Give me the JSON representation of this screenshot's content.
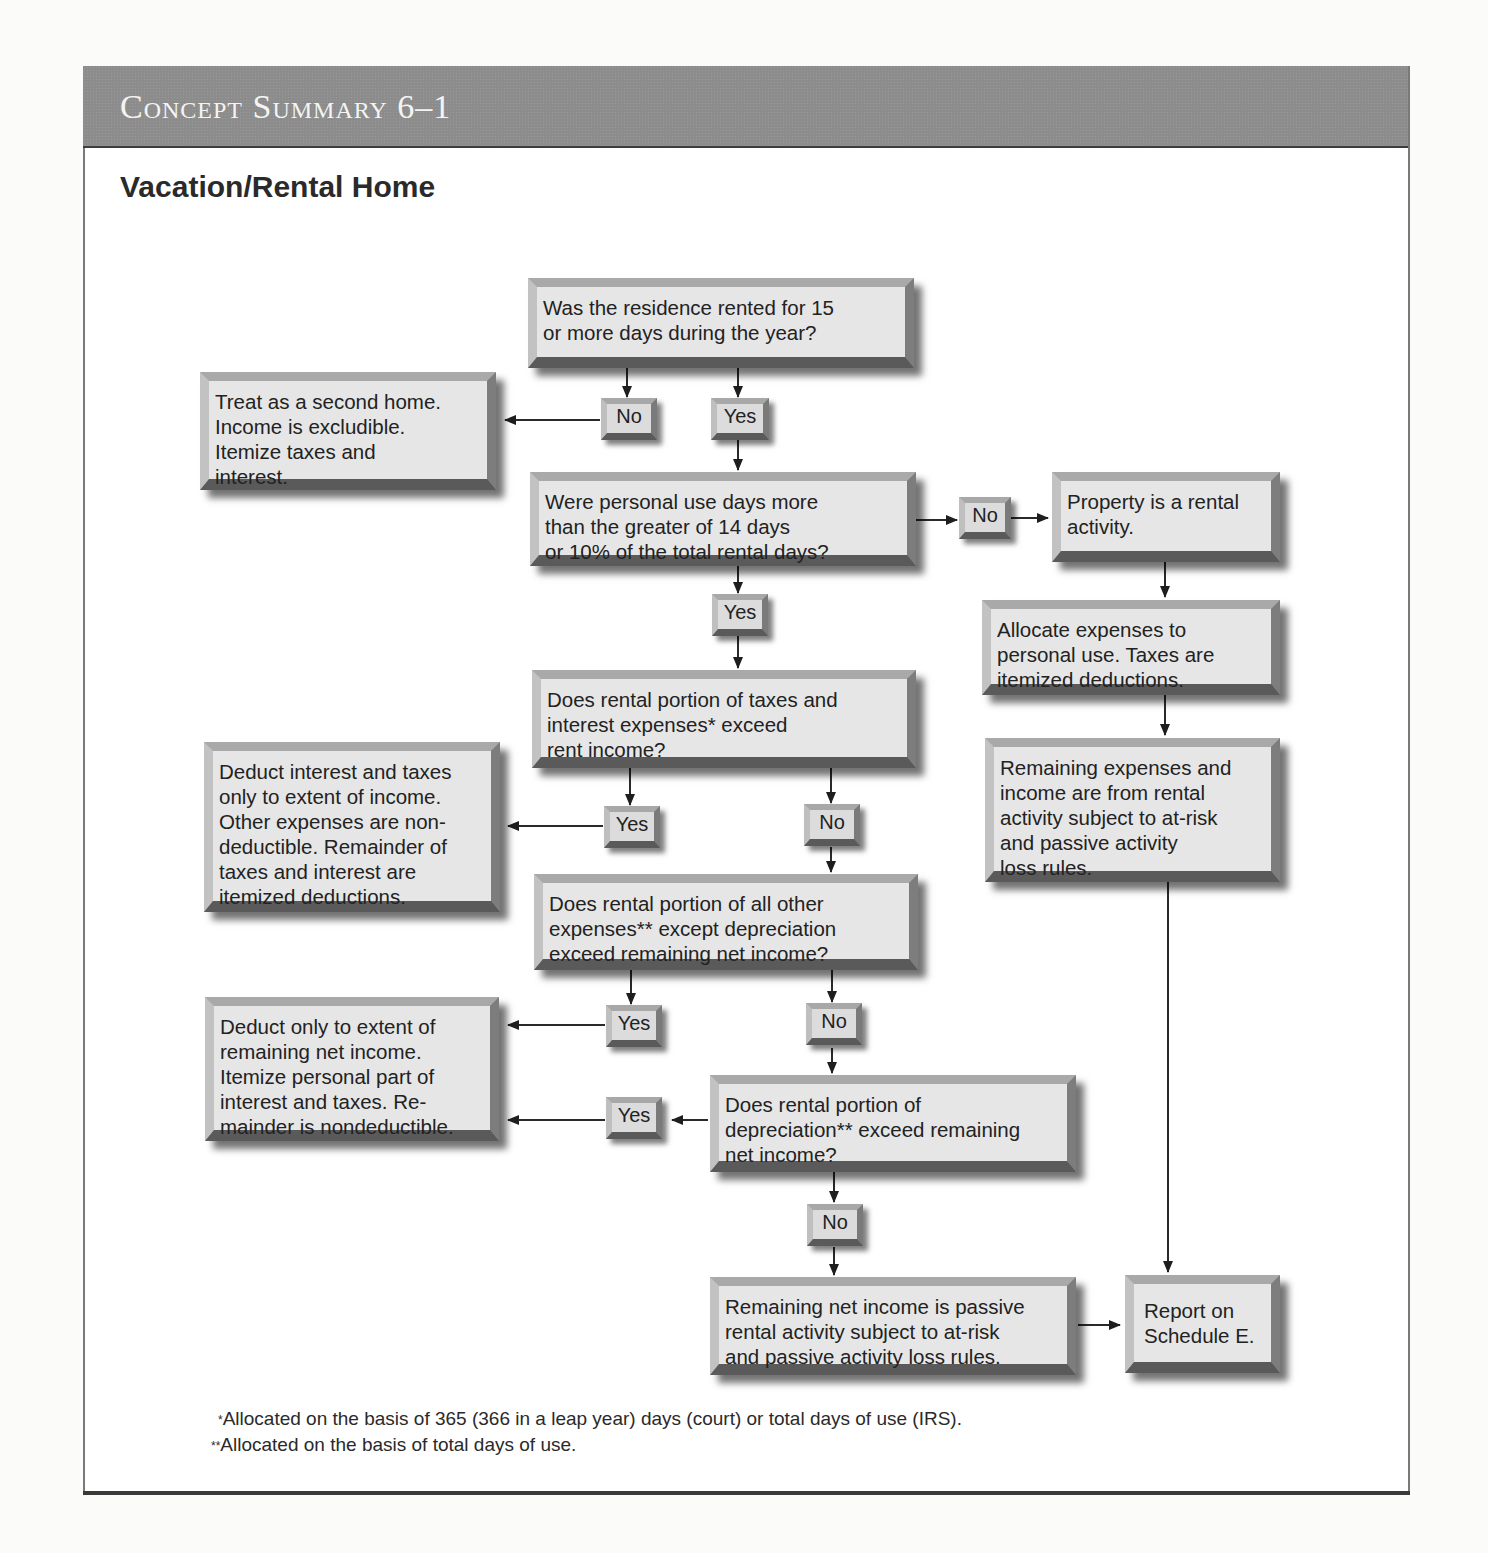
{
  "header": {
    "title": "Concept Summary 6–1",
    "subtitle": "Vacation/Rental Home"
  },
  "flowchart": {
    "nodes": {
      "q1": "Was the residence rented for 15\nor more days during the year?",
      "second_home": "Treat as a second home.\nIncome is excludible.\nItemize taxes and\ninterest.",
      "q2": "Were personal use days more\nthan the greater of 14 days\nor 10% of the total rental days?",
      "rental_activity": "Property is a rental\nactivity.",
      "allocate": "Allocate expenses to\npersonal use. Taxes are\nitemized deductions.",
      "remaining_rental": "Remaining expenses and\nincome are from rental\nactivity subject to at-risk\nand passive activity\nloss rules.",
      "q3": "Does rental portion of taxes and\ninterest expenses* exceed\nrent income?",
      "deduct_interest": "Deduct interest and taxes\nonly to extent of income.\nOther expenses are non-\ndeductible. Remainder of\ntaxes and interest are\nitemized deductions.",
      "q4": "Does rental portion of all other\nexpenses** except depreciation\nexceed remaining net income?",
      "deduct_remaining": "Deduct only to extent of\nremaining net income.\nItemize personal part of\ninterest and taxes. Re-\nmainder is nondeductible.",
      "q5": "Does rental portion of\ndepreciation** exceed remaining\nnet income?",
      "passive": "Remaining net income is passive\nrental activity subject to at-risk\nand passive activity loss rules.",
      "schedule_e": "Report on\nSchedule E."
    },
    "labels": {
      "q1_no": "No",
      "q1_yes": "Yes",
      "q2_no": "No",
      "q2_yes": "Yes",
      "q3_yes": "Yes",
      "q3_no": "No",
      "q4_yes": "Yes",
      "q4_no": "No",
      "q5_yes": "Yes",
      "q5_no": "No"
    }
  },
  "footnotes": {
    "single_mark": "*",
    "single": "Allocated on the basis of 365 (366 in a leap year) days (court) or total days of use (IRS).",
    "double_mark": "**",
    "double": "Allocated on the basis of total days of use."
  }
}
